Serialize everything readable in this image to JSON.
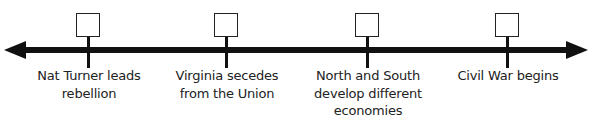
{
  "timeline": {
    "events": [
      {
        "label": "Nat Turner leads\nrebellion",
        "box_value": "",
        "x": 89
      },
      {
        "label": "Virginia secedes\nfrom the Union",
        "box_value": "",
        "x": 227
      },
      {
        "label": "North and South\ndevelop different\neconomies",
        "box_value": "",
        "x": 368
      },
      {
        "label": "Civil War begins",
        "box_value": "",
        "x": 508
      }
    ],
    "colors": {
      "line": "#111111",
      "text": "#222222",
      "background": "#ffffff"
    }
  }
}
